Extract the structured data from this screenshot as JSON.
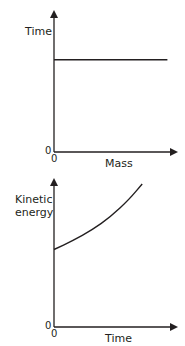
{
  "chart_data": [
    {
      "type": "line",
      "title": "",
      "xlabel": "Mass",
      "ylabel": "Time",
      "x_origin_label": "0",
      "y_origin_label": "0",
      "xlim": [
        0,
        1
      ],
      "ylim": [
        0,
        1
      ],
      "grid": false,
      "series": [
        {
          "name": "time-vs-mass",
          "x": [
            0,
            0.9
          ],
          "y": [
            0.65,
            0.65
          ]
        }
      ]
    },
    {
      "type": "line",
      "title": "",
      "xlabel": "Time",
      "ylabel_lines": [
        "Kinetic",
        "energy"
      ],
      "x_origin_label": "0",
      "y_origin_label": "0",
      "xlim": [
        0,
        1
      ],
      "ylim": [
        0,
        1
      ],
      "grid": false,
      "series": [
        {
          "name": "kinetic-energy-vs-time",
          "x": [
            0,
            0.15,
            0.3,
            0.45,
            0.6,
            0.7
          ],
          "y": [
            0.52,
            0.58,
            0.65,
            0.74,
            0.86,
            0.96
          ]
        }
      ]
    }
  ],
  "colors": {
    "ink": "#231f20",
    "background": "#ffffff"
  }
}
